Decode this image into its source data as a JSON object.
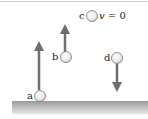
{
  "diagram": {
    "colors": {
      "arrow": "#6e6e6e",
      "ground_top": "#9a9a9a",
      "ground_bottom": "#e2e2e2",
      "ball_fill": "#f2f2f2",
      "ball_stroke": "#7a7a7a",
      "border": "#cfcfcf"
    },
    "balls": [
      {
        "id": "a",
        "label": "a",
        "arrow": "up-long"
      },
      {
        "id": "b",
        "label": "b",
        "arrow": "up-short"
      },
      {
        "id": "c",
        "label": "c",
        "arrow": "none",
        "annotation_var": "v",
        "annotation_rest": " = 0"
      },
      {
        "id": "d",
        "label": "d",
        "arrow": "down"
      }
    ],
    "ground": "ground-surface"
  }
}
